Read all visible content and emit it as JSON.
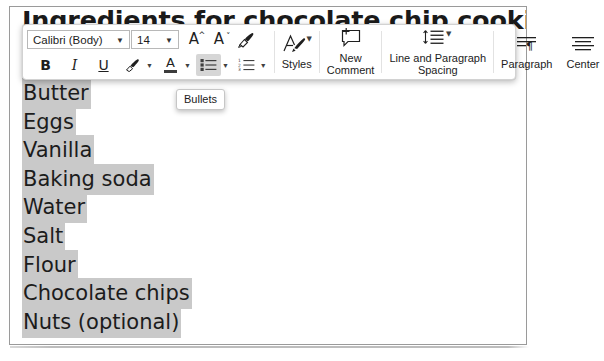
{
  "document": {
    "title": "Ingredients for chocolate chip cookies",
    "ingredients": [
      "Butter",
      "Eggs",
      "Vanilla",
      "Baking soda",
      "Water",
      "Salt",
      "Flour",
      "Chocolate chips",
      "Nuts (optional)"
    ],
    "selection_highlight_color": "#c9c9c9"
  },
  "toolbar": {
    "font_name": "Calibri (Body)",
    "font_size": "14",
    "grow_font_label": "A",
    "shrink_font_label": "A",
    "bold_label": "B",
    "italic_label": "I",
    "underline_label": "U",
    "font_color_label": "A",
    "styles_label": "Styles",
    "new_comment_label": "New\nComment",
    "line_spacing_label": "Line and Paragraph\nSpacing",
    "paragraph_label": "Paragraph",
    "center_label": "Center"
  },
  "tooltip": {
    "bullets_label": "Bullets"
  }
}
